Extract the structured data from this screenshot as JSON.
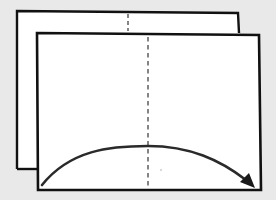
{
  "diagram": {
    "colors": {
      "background": "#e9e9e9",
      "paper": "#ffffff",
      "outline": "#111111",
      "fold_line": "#666666",
      "arrow": "#2a2a2a"
    },
    "back_sheet": {
      "x1": 17,
      "y1": 11,
      "x2": 238,
      "y2": 169
    },
    "front_sheet": {
      "x1": 37,
      "y1": 33,
      "x2": 260,
      "y2": 190
    },
    "fold_lines": [
      {
        "sheet": "back",
        "x": 128,
        "y_start": 14,
        "y_end": 31,
        "style": "dashed"
      },
      {
        "sheet": "front",
        "x": 148,
        "y_start": 36,
        "y_end": 187,
        "style": "dashed"
      }
    ],
    "arrow": {
      "direction": "left-to-right",
      "start": [
        42,
        185
      ],
      "peak": [
        148,
        146
      ],
      "end": [
        254,
        187
      ]
    }
  }
}
